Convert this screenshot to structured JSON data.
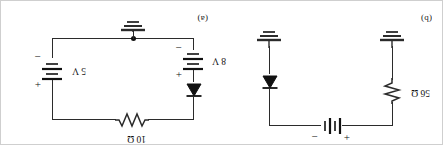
{
  "figure": {
    "orientation_degrees": 180,
    "ink_color": "#2b2b2b",
    "text_color": "#111111",
    "background": "#ffffff"
  },
  "panels": [
    {
      "id": "panel-a",
      "label": "(a)",
      "components": [
        {
          "name": "battery-8v",
          "type": "battery",
          "value": "8 V",
          "plus": "+",
          "minus": "−"
        },
        {
          "name": "battery-5v",
          "type": "battery",
          "value": "5 V",
          "plus": "+",
          "minus": "−"
        },
        {
          "name": "resistor-10ohm",
          "type": "resistor",
          "value": "10 Ω"
        },
        {
          "name": "diode",
          "type": "diode",
          "value": ""
        },
        {
          "name": "ground",
          "type": "ground",
          "value": ""
        },
        {
          "name": "junction-node",
          "type": "node",
          "value": ""
        }
      ]
    },
    {
      "id": "panel-b",
      "label": "(b)",
      "components": [
        {
          "name": "resistor-56ohm",
          "type": "resistor",
          "value": "56 Ω"
        },
        {
          "name": "battery-100v",
          "type": "battery",
          "value": "100 V",
          "plus": "+",
          "minus": "−"
        },
        {
          "name": "diode",
          "type": "diode",
          "value": ""
        },
        {
          "name": "ground-left",
          "type": "ground",
          "value": ""
        },
        {
          "name": "ground-right",
          "type": "ground",
          "value": ""
        }
      ]
    }
  ],
  "labels": {
    "panel_a_tag": "(a)",
    "panel_b_tag": "(b)",
    "r56": "56 Ω",
    "v100": "100 V",
    "v100_plus": "+",
    "v100_minus": "−",
    "v8": "8 V",
    "v8_plus": "+",
    "v8_minus": "−",
    "v5": "5 V",
    "v5_plus": "+",
    "v5_minus": "−",
    "r10": "10 Ω"
  }
}
